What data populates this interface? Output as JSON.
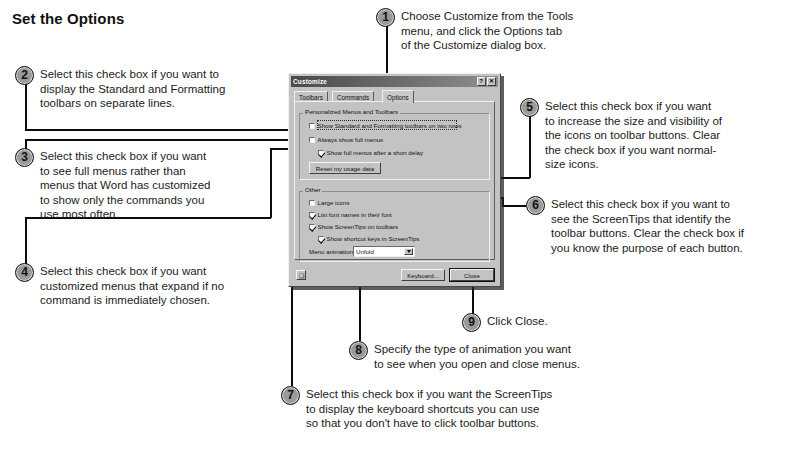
{
  "page_title": "Set the Options",
  "callouts": [
    {
      "num": "1",
      "text": "Choose Customize from the Tools\nmenu, and click the Options tab\nof the Customize dialog box."
    },
    {
      "num": "2",
      "text": "Select this check box if you want to\ndisplay the Standard and Formatting\ntoolbars on separate lines."
    },
    {
      "num": "3",
      "text": "Select this check box if you want\nto see full menus rather than\nmenus that Word has customized\nto show only the commands you\nuse most often."
    },
    {
      "num": "4",
      "text": "Select this check box if you want\ncustomized menus that expand if no\ncommand is immediately chosen."
    },
    {
      "num": "5",
      "text": "Select this check box if you want\nto increase the size and visibility of\nthe icons on toolbar buttons. Clear\nthe check box if you want normal-\nsize icons."
    },
    {
      "num": "6",
      "text": "Select this check box if you want to\nsee the ScreenTips that identify the\ntoolbar buttons. Clear the check box if\nyou know the purpose of each button."
    },
    {
      "num": "7",
      "text": "Select this check box if you want the ScreenTips\nto display the keyboard shortcuts you can use\nso that you don't have to click toolbar buttons."
    },
    {
      "num": "8",
      "text": "Specify the type of animation you want\nto see when you open and close menus."
    },
    {
      "num": "9",
      "text": "Click Close."
    }
  ],
  "dialog": {
    "title": "Customize",
    "help_button": "?",
    "close_button": "✕",
    "tabs": [
      {
        "label": "Toolbars",
        "active": false
      },
      {
        "label": "Commands",
        "active": false
      },
      {
        "label": "Options",
        "active": true
      }
    ],
    "group_personalized": {
      "label": "Personalized Menus and Toolbars",
      "checkboxes": [
        {
          "label": "Show Standard and Formatting toolbars on two rows",
          "checked": false,
          "focused": true
        },
        {
          "label": "Always show full menus",
          "checked": false,
          "focused": false
        },
        {
          "label": "Show full menus after a short delay",
          "checked": true,
          "focused": false
        }
      ],
      "reset_button": "Reset my usage data"
    },
    "group_other": {
      "label": "Other",
      "checkboxes": [
        {
          "label": "Large icons",
          "checked": false
        },
        {
          "label": "List font names in their font",
          "checked": true
        },
        {
          "label": "Show ScreenTips on toolbars",
          "checked": true
        },
        {
          "label": "Show shortcut keys in ScreenTips",
          "checked": true
        }
      ],
      "menu_animations_label": "Menu animations:",
      "menu_animations_value": "Unfold"
    },
    "footer": {
      "help_icon": "❑",
      "keyboard_button": "Keyboard...",
      "close_button": "Close"
    }
  },
  "colors": {
    "bullet_fill": "#9a9a9a",
    "line": "#0d0d0d",
    "dialog_face": "#c3c3c3",
    "titlebar": "#5c5c5c"
  }
}
